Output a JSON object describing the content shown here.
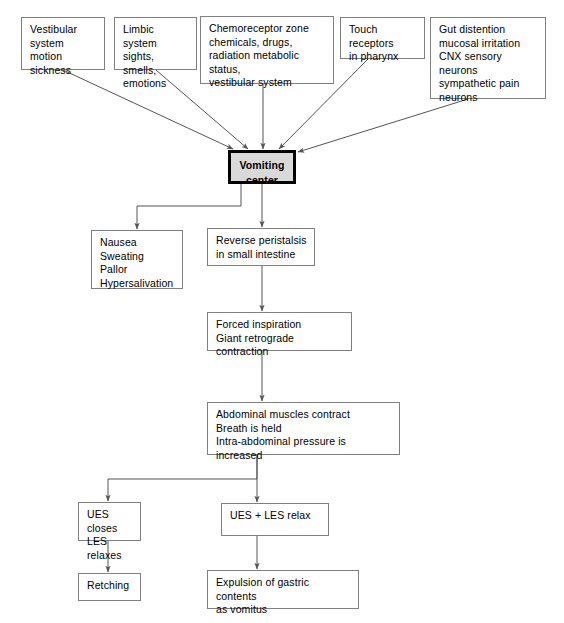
{
  "diagram": {
    "type": "flowchart",
    "canvas": {
      "width": 564,
      "height": 623
    },
    "colors": {
      "box_border": "#808080",
      "center_border": "#000000",
      "center_fill": "#d9d9d9",
      "edge": "#555555",
      "background": "#ffffff",
      "text": "#000000"
    }
  },
  "nodes": {
    "vestibular": {
      "label": "Vestibular\nsystem\nmotion sickness",
      "x": 21,
      "y": 17,
      "w": 84,
      "h": 53
    },
    "limbic": {
      "label": "Limbic system\nsights, smells,\nemotions",
      "x": 114,
      "y": 17,
      "w": 83,
      "h": 53
    },
    "chemoreceptor": {
      "label": "Chemoreceptor zone\nchemicals, drugs,\nradiation metabolic status,\nvestibular system",
      "x": 200,
      "y": 16,
      "w": 134,
      "h": 68
    },
    "touch": {
      "label": "Touch receptors\nin pharynx",
      "x": 340,
      "y": 17,
      "w": 85,
      "h": 42
    },
    "gut": {
      "label": "Gut distention\nmucosal irritation\nCNX sensory neurons\nsympathetic pain\nneurons",
      "x": 430,
      "y": 17,
      "w": 116,
      "h": 82
    },
    "vomiting_center": {
      "label": "Vomiting\ncenter",
      "x": 228,
      "y": 150,
      "w": 68,
      "h": 34
    },
    "nausea": {
      "label": "Nausea\nSweating\nPallor\nHypersalivation",
      "x": 91,
      "y": 230,
      "w": 92,
      "h": 59
    },
    "reverse_peristalsis": {
      "label": "Reverse peristalsis\nin small intestine",
      "x": 207,
      "y": 228,
      "w": 108,
      "h": 38
    },
    "forced_inspiration": {
      "label": "Forced inspiration\nGiant retrograde contraction",
      "x": 207,
      "y": 312,
      "w": 145,
      "h": 39
    },
    "abdominal": {
      "label": "Abdominal muscles contract\nBreath is held\nIntra-abdominal pressure is increased",
      "x": 207,
      "y": 402,
      "w": 193,
      "h": 53
    },
    "ues_closes": {
      "label": "UES closes\nLES relaxes",
      "x": 78,
      "y": 502,
      "w": 63,
      "h": 39
    },
    "ues_les_relax": {
      "label": "UES + LES relax",
      "x": 221,
      "y": 503,
      "w": 108,
      "h": 33
    },
    "retching": {
      "label": "Retching",
      "x": 78,
      "y": 573,
      "w": 63,
      "h": 28
    },
    "expulsion": {
      "label": "Expulsion of gastric contents\nas vomitus",
      "x": 207,
      "y": 570,
      "w": 152,
      "h": 39
    }
  },
  "edges": [
    {
      "name": "vestibular-to-center",
      "from": "vestibular",
      "to": "vomiting_center"
    },
    {
      "name": "limbic-to-center",
      "from": "limbic",
      "to": "vomiting_center"
    },
    {
      "name": "chemoreceptor-to-center",
      "from": "chemoreceptor",
      "to": "vomiting_center"
    },
    {
      "name": "touch-to-center",
      "from": "touch",
      "to": "vomiting_center"
    },
    {
      "name": "gut-to-center",
      "from": "gut",
      "to": "vomiting_center"
    },
    {
      "name": "center-to-nausea",
      "from": "vomiting_center",
      "to": "nausea"
    },
    {
      "name": "center-to-reverse-peristalsis",
      "from": "vomiting_center",
      "to": "reverse_peristalsis"
    },
    {
      "name": "reverse-peristalsis-to-forced-inspiration",
      "from": "reverse_peristalsis",
      "to": "forced_inspiration"
    },
    {
      "name": "forced-inspiration-to-abdominal",
      "from": "forced_inspiration",
      "to": "abdominal"
    },
    {
      "name": "abdominal-to-ues-closes",
      "from": "abdominal",
      "to": "ues_closes"
    },
    {
      "name": "abdominal-to-ues-les-relax",
      "from": "abdominal",
      "to": "ues_les_relax"
    },
    {
      "name": "ues-closes-to-retching",
      "from": "ues_closes",
      "to": "retching"
    },
    {
      "name": "ues-les-relax-to-expulsion",
      "from": "ues_les_relax",
      "to": "expulsion"
    }
  ]
}
